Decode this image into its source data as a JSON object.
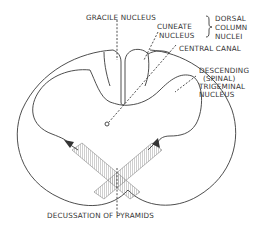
{
  "figure": {
    "type": "anatomical cross-section"
  },
  "labels": {
    "gracile_nucleus": "GRACILE NUCLEUS",
    "cuneate_line1": "CUNEATE",
    "cuneate_line2": "NUCLEUS",
    "dorsal_line1": "DORSAL",
    "dorsal_line2": "COLUMN",
    "dorsal_line3": "NUCLEI",
    "central_canal": "CENTRAL CANAL",
    "trigeminal_line1": "DESCENDING",
    "trigeminal_line2": "(SPINAL)",
    "trigeminal_line3": "TRIGEMINAL",
    "trigeminal_line4": "NUCLEUS",
    "decussation": "DECUSSATION OF PYRAMIDS"
  },
  "colors": {
    "line": "#3a3a3a",
    "hatch": "#9a9a9a",
    "text": "#333333",
    "background": "#ffffff"
  }
}
